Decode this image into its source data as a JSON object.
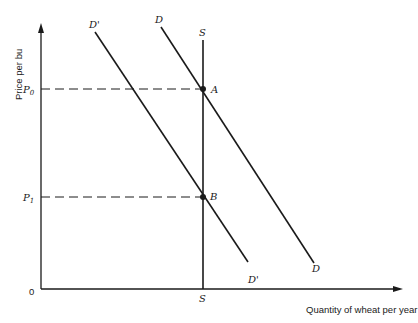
{
  "diagram": {
    "y_axis_label": "Price per bu",
    "x_axis_label": "Quantity of wheat per year",
    "origin_label": "0",
    "price_levels": [
      {
        "label": "P",
        "sub": "0",
        "y": 89
      },
      {
        "label": "P",
        "sub": "1",
        "y": 197
      }
    ],
    "curves": {
      "demand": {
        "top_label": "D",
        "bottom_label": "D"
      },
      "demand_shifted": {
        "top_label": "D'",
        "bottom_label": "D'"
      },
      "supply": {
        "top_label": "S",
        "bottom_label": "S"
      }
    },
    "points": [
      {
        "label": "A"
      },
      {
        "label": "B"
      }
    ],
    "colors": {
      "ink": "#1a1a1a",
      "background": "#ffffff"
    }
  }
}
